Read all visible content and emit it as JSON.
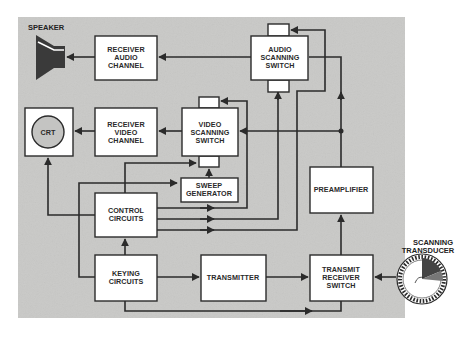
{
  "diagram": {
    "type": "block-diagram",
    "colors": {
      "panel": "#c9c9c7",
      "box_fill": "#ffffff",
      "line": "#2b2b2b",
      "speaker": "#3a3a3a"
    },
    "external_labels": {
      "speaker": "SPEAKER",
      "transducer_line1": "SCANNING",
      "transducer_line2": "TRANSDUCER"
    },
    "blocks": {
      "receiver_audio": {
        "line1": "RECEIVER",
        "line2": "AUDIO",
        "line3": "CHANNEL"
      },
      "audio_switch": {
        "line1": "AUDIO",
        "line2": "SCANNING",
        "line3": "SWITCH"
      },
      "crt": {
        "label": "CRT"
      },
      "receiver_video": {
        "line1": "RECEIVER",
        "line2": "VIDEO",
        "line3": "CHANNEL"
      },
      "video_switch": {
        "line1": "VIDEO",
        "line2": "SCANNING",
        "line3": "SWITCH"
      },
      "sweep": {
        "line1": "SWEEP",
        "line2": "GENERATOR"
      },
      "control": {
        "line1": "CONTROL",
        "line2": "CIRCUITS"
      },
      "preamp": {
        "label": "PREAMPLIFIER"
      },
      "keying": {
        "line1": "KEYING",
        "line2": "CIRCUITS"
      },
      "transmitter": {
        "label": "TRANSMITTER"
      },
      "tr_switch": {
        "line1": "TRANSMIT",
        "line2": "RECEIVER",
        "line3": "SWITCH"
      }
    },
    "connections": [
      {
        "from": "AUDIO SCANNING SWITCH",
        "to": "RECEIVER AUDIO CHANNEL"
      },
      {
        "from": "RECEIVER AUDIO CHANNEL",
        "to": "SPEAKER"
      },
      {
        "from": "VIDEO SCANNING SWITCH",
        "to": "RECEIVER VIDEO CHANNEL"
      },
      {
        "from": "RECEIVER VIDEO CHANNEL",
        "to": "CRT"
      },
      {
        "from": "PREAMPLIFIER",
        "to": "VIDEO SCANNING SWITCH"
      },
      {
        "from": "PREAMPLIFIER",
        "to": "AUDIO SCANNING SWITCH"
      },
      {
        "from": "SWEEP GENERATOR",
        "to": "VIDEO SCANNING SWITCH"
      },
      {
        "from": "CONTROL CIRCUITS",
        "to": "CRT"
      },
      {
        "from": "CONTROL CIRCUITS",
        "to": "VIDEO SCANNING SWITCH"
      },
      {
        "from": "CONTROL CIRCUITS",
        "to": "AUDIO SCANNING SWITCH"
      },
      {
        "from": "KEYING CIRCUITS",
        "to": "CONTROL CIRCUITS"
      },
      {
        "from": "KEYING CIRCUITS",
        "to": "SWEEP GENERATOR"
      },
      {
        "from": "KEYING CIRCUITS",
        "to": "TRANSMITTER"
      },
      {
        "from": "KEYING CIRCUITS",
        "to": "TRANSMIT RECEIVER SWITCH"
      },
      {
        "from": "TRANSMITTER",
        "to": "TRANSMIT RECEIVER SWITCH"
      },
      {
        "from": "SCANNING TRANSDUCER",
        "to": "TRANSMIT RECEIVER SWITCH"
      },
      {
        "from": "TRANSMIT RECEIVER SWITCH",
        "to": "PREAMPLIFIER"
      }
    ]
  }
}
